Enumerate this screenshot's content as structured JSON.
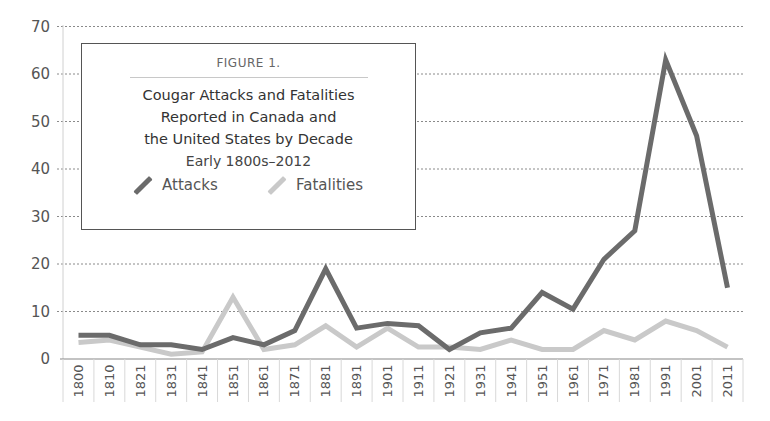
{
  "chart_data": {
    "type": "line",
    "figure_label": "FIGURE 1.",
    "title": "Cougar Attacks and Fatalities Reported in Canada and the United States by Decade",
    "title_lines": [
      "Cougar Attacks and Fatalities",
      "Reported in Canada and",
      "the United States by Decade"
    ],
    "subtitle": "Early 1800s–2012",
    "xlabel": "",
    "ylabel": "",
    "ylim": [
      0,
      70
    ],
    "yticks": [
      0,
      10,
      20,
      30,
      40,
      50,
      60,
      70
    ],
    "grid": "horizontal dotted",
    "legend_position": "upper-left box",
    "categories": [
      "1800",
      "1810",
      "1821",
      "1831",
      "1841",
      "1851",
      "1861",
      "1871",
      "1881",
      "1891",
      "1901",
      "1911",
      "1921",
      "1931",
      "1941",
      "1951",
      "1961",
      "1971",
      "1981",
      "1991",
      "2001",
      "2011"
    ],
    "series": [
      {
        "name": "Attacks",
        "color": "#6b6b6b",
        "values": [
          5,
          5,
          3,
          3,
          2,
          4.5,
          3,
          6,
          19,
          6.5,
          7.5,
          7,
          2,
          5.5,
          6.5,
          14,
          10.5,
          21,
          27,
          63,
          47,
          15
        ]
      },
      {
        "name": "Fatalities",
        "color": "#c9c9c9",
        "values": [
          3.5,
          4,
          2.5,
          1,
          1.5,
          13,
          2,
          3,
          7,
          2.5,
          6.5,
          2.5,
          2.5,
          2,
          4,
          2,
          2,
          6,
          4,
          8,
          6,
          2.5
        ]
      }
    ]
  },
  "legend": {
    "attacks_label": "Attacks",
    "fatalities_label": "Fatalities"
  }
}
